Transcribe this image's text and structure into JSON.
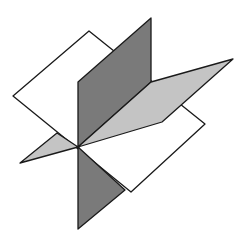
{
  "figure": {
    "width": 234,
    "height": 245,
    "colors": {
      "background": "#ffffff",
      "white_plane": "#ffffff",
      "dark_plane": "#7a7a7a",
      "light_plane": "#c4c4c4",
      "edge": "#1a1a1a"
    },
    "intersection_point": [
      78,
      147
    ],
    "planes": [
      {
        "name": "horizontal-white-plane",
        "fill": "white",
        "vertices": [
          [
            89,
            31
          ],
          [
            205,
            124
          ],
          [
            131,
            192
          ],
          [
            13,
            96
          ]
        ]
      },
      {
        "name": "vertical-dark-plane",
        "fill": "dark gray",
        "upper_part": [
          [
            78,
            82
          ],
          [
            151,
            18
          ],
          [
            151,
            82
          ],
          [
            78,
            147
          ]
        ],
        "lower_part": [
          [
            78,
            147
          ],
          [
            125,
            190
          ],
          [
            78,
            229
          ]
        ]
      },
      {
        "name": "oblique-light-plane",
        "fill": "light gray",
        "right_part": [
          [
            78,
            147
          ],
          [
            151,
            82
          ],
          [
            233,
            59
          ],
          [
            162,
            122
          ]
        ],
        "left_part": [
          [
            78,
            147
          ],
          [
            57,
            133
          ],
          [
            20,
            163
          ]
        ]
      }
    ]
  }
}
